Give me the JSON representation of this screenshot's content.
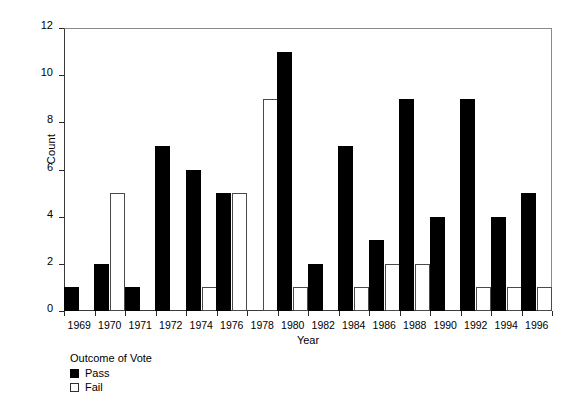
{
  "chart_data": {
    "type": "bar",
    "title": "",
    "xlabel": "Year",
    "ylabel": "Count",
    "ylim": [
      0,
      12
    ],
    "yticks": [
      0,
      2,
      4,
      6,
      8,
      10,
      12
    ],
    "grid": false,
    "legend_title": "Outcome of Vote",
    "legend_position": "below-left",
    "categories": [
      "1969",
      "1970",
      "1971",
      "1972",
      "1974",
      "1976",
      "1978",
      "1980",
      "1982",
      "1984",
      "1986",
      "1988",
      "1990",
      "1992",
      "1994",
      "1996"
    ],
    "series": [
      {
        "name": "Pass",
        "color": "#000000",
        "style": "filled",
        "values": [
          1,
          2,
          1,
          7,
          6,
          5,
          0,
          11,
          2,
          7,
          3,
          9,
          4,
          9,
          4,
          5
        ]
      },
      {
        "name": "Fail",
        "color": "#ffffff",
        "style": "outline",
        "values": [
          0,
          5,
          0,
          0,
          1,
          5,
          9,
          1,
          0,
          1,
          2,
          2,
          0,
          1,
          1,
          1
        ]
      }
    ]
  },
  "axes": {
    "y_title": "Count",
    "x_title": "Year",
    "y_tick_labels": [
      "0",
      "2",
      "4",
      "6",
      "8",
      "10",
      "12"
    ],
    "x_tick_labels": [
      "1969",
      "1970",
      "1971",
      "1972",
      "1974",
      "1976",
      "1978",
      "1980",
      "1982",
      "1984",
      "1986",
      "1988",
      "1990",
      "1992",
      "1994",
      "1996"
    ]
  },
  "legend": {
    "title": "Outcome of Vote",
    "items": [
      {
        "label": "Pass",
        "swatch": "filled-black"
      },
      {
        "label": "Fail",
        "swatch": "outline-white"
      }
    ]
  }
}
